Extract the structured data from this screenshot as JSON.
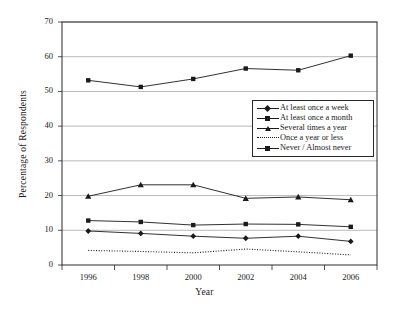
{
  "chart_data": {
    "type": "line",
    "title": "",
    "xlabel": "Year",
    "ylabel": "Percentage of Respondents",
    "categories": [
      1996,
      1998,
      2000,
      2002,
      2004,
      2006
    ],
    "x_tick_labels": [
      "1996",
      "1998",
      "2000",
      "2002",
      "2004",
      "2006"
    ],
    "y_tick_labels": [
      "0",
      "10",
      "20",
      "30",
      "40",
      "50",
      "60",
      "70"
    ],
    "y_ticks": [
      0,
      10,
      20,
      30,
      40,
      50,
      60,
      70
    ],
    "ylim": [
      0,
      70
    ],
    "xlim": [
      1995,
      2007
    ],
    "grid": "horizontal",
    "legend_position": "upper-right-inside",
    "series": [
      {
        "name": "At least once a week",
        "marker": "diamond",
        "line_style": "solid",
        "color": "#1a1a1a",
        "values": [
          9.8,
          9.1,
          8.3,
          7.7,
          8.3,
          6.8
        ]
      },
      {
        "name": "At least once a month",
        "marker": "square",
        "line_style": "solid",
        "color": "#1a1a1a",
        "values": [
          12.8,
          12.4,
          11.5,
          11.8,
          11.7,
          11.0
        ]
      },
      {
        "name": "Several times a year",
        "marker": "triangle",
        "line_style": "solid",
        "color": "#1a1a1a",
        "values": [
          19.8,
          23.1,
          23.1,
          19.2,
          19.6,
          18.8
        ]
      },
      {
        "name": "Once a year or less",
        "marker": "none",
        "line_style": "dotted",
        "color": "#1a1a1a",
        "values": [
          4.2,
          3.9,
          3.5,
          4.6,
          3.8,
          2.9
        ]
      },
      {
        "name": "Never / Almost never",
        "marker": "square",
        "line_style": "solid",
        "color": "#1a1a1a",
        "values": [
          53.2,
          51.3,
          53.6,
          56.6,
          56.1,
          60.3
        ]
      }
    ]
  },
  "legend": {
    "entries": [
      "At least once a week",
      "At least once a month",
      "Several times a year",
      "Once a year or less",
      "Never / Almost never"
    ]
  },
  "colors": {
    "ink": "#1a1a1a",
    "grid": "#9a9a9a",
    "frame": "#2a2a2a",
    "background": "#ffffff"
  }
}
